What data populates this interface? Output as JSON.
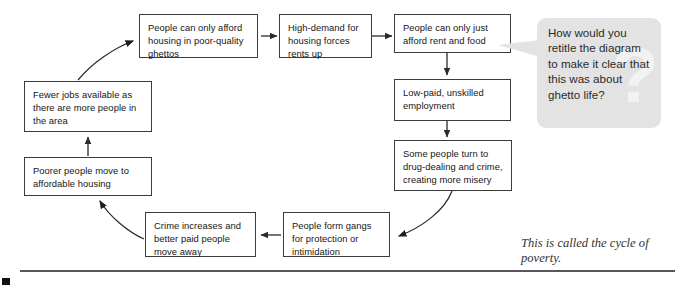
{
  "diagram": {
    "title_caption": "This is called the cycle of poverty.",
    "nodes": [
      {
        "id": "poor-quality-ghettos",
        "text": "People can only afford housing in poor-quality ghettos"
      },
      {
        "id": "high-demand-rents",
        "text": "High-demand for housing forces rents up"
      },
      {
        "id": "afford-rent-food",
        "text": "People can only just afford rent and food"
      },
      {
        "id": "low-paid-employment",
        "text": "Low-paid, unskilled employment"
      },
      {
        "id": "drug-dealing-crime",
        "text": "Some people turn to drug-dealing and crime, creating more misery"
      },
      {
        "id": "people-form-gangs",
        "text": "People form gangs for protection or intimidation"
      },
      {
        "id": "crime-increases",
        "text": "Crime increases and better paid people move away"
      },
      {
        "id": "poorer-people-move",
        "text": "Poorer people move to affordable housing"
      },
      {
        "id": "fewer-jobs",
        "text": "Fewer jobs available as there are more people in the area"
      }
    ],
    "edges": [
      {
        "from": "poor-quality-ghettos",
        "to": "high-demand-rents",
        "style": "straight-right"
      },
      {
        "from": "high-demand-rents",
        "to": "afford-rent-food",
        "style": "straight-right"
      },
      {
        "from": "afford-rent-food",
        "to": "low-paid-employment",
        "style": "straight-down"
      },
      {
        "from": "low-paid-employment",
        "to": "drug-dealing-crime",
        "style": "straight-down"
      },
      {
        "from": "drug-dealing-crime",
        "to": "people-form-gangs",
        "style": "curved"
      },
      {
        "from": "people-form-gangs",
        "to": "crime-increases",
        "style": "straight-left"
      },
      {
        "from": "crime-increases",
        "to": "poorer-people-move",
        "style": "curved"
      },
      {
        "from": "poorer-people-move",
        "to": "fewer-jobs",
        "style": "straight-up"
      },
      {
        "from": "fewer-jobs",
        "to": "poor-quality-ghettos",
        "style": "curved"
      }
    ]
  },
  "callout": {
    "question": "How would you retitle the diagram to make it clear that this was about ghetto life?",
    "watermark": "?",
    "background_color": "#e3e3e3"
  },
  "colors": {
    "box_border": "#3c3c3c",
    "arrow": "#2a2a2a",
    "rule": "#58585a",
    "text": "#161616"
  }
}
